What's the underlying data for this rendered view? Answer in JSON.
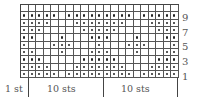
{
  "chart_data": {
    "type": "knitting-chart",
    "columns": 21,
    "rows": 10,
    "symbol": {
      "dot": "purl on RS (knit on WS)",
      "blank": "knit on RS"
    },
    "grid_rows_top_to_bottom": [
      "000000000000000000000",
      "111110111111111011111",
      "111100011111110001111",
      "111000001111100000111",
      "110001000111000100011",
      "100011100010001110001",
      "110001000111000100011",
      "111000001111100000111",
      "111100011111110001111",
      "111110111111111011111"
    ],
    "row_labels": [
      "9",
      "7",
      "5",
      "3",
      "1"
    ],
    "bottom_labels": [
      "1 st",
      "10 sts",
      "10 sts"
    ]
  },
  "labels": {
    "row_9": "9",
    "row_7": "7",
    "row_5": "5",
    "row_3": "3",
    "row_1": "1",
    "edge": "1 st",
    "repeat_a": "10 sts",
    "repeat_b": "10 sts"
  },
  "colors": {
    "grid_line": "#555555",
    "dot": "#222222",
    "text": "#555555"
  }
}
